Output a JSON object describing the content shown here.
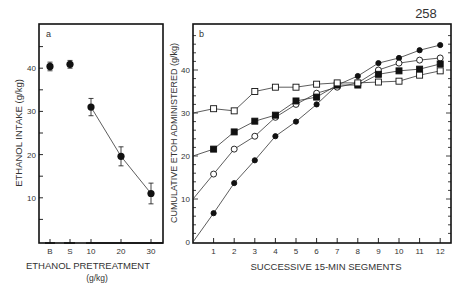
{
  "page_number": "258",
  "chart_data": [
    {
      "panel": "a",
      "type": "scatter",
      "title": "",
      "panel_label": "a",
      "xlabel": "ETHANOL PRETREATMENT",
      "xlabel_units": "(g/kg)",
      "ylabel": "ETHANOL INTAKE (g/kg)",
      "categories": [
        "B",
        "S",
        "10",
        "20",
        "30"
      ],
      "values": [
        40.4,
        40.9,
        31.0,
        19.6,
        11.0
      ],
      "error": [
        1.0,
        0.9,
        2.0,
        2.2,
        2.4
      ],
      "connected": [
        false,
        false,
        true,
        true,
        true
      ],
      "yticks": [
        10,
        20,
        30,
        40
      ],
      "ylim": [
        0,
        50
      ],
      "grid": false,
      "marker": "filled-circle"
    },
    {
      "panel": "b",
      "type": "line",
      "title": "",
      "panel_label": "b",
      "xlabel": "SUCCESSIVE 15-MIN SEGMENTS",
      "ylabel": "CUMULATIVE ETOH ADMINISTERED (g/kg)",
      "x": [
        0,
        1,
        2,
        3,
        4,
        5,
        6,
        7,
        8,
        9,
        10,
        11,
        12
      ],
      "xticks": [
        1,
        2,
        3,
        4,
        5,
        6,
        7,
        8,
        9,
        10,
        11,
        12
      ],
      "yticks": [
        0,
        10,
        20,
        30,
        40
      ],
      "xlim": [
        0,
        12.5
      ],
      "ylim": [
        0,
        50
      ],
      "grid": false,
      "legend": "none",
      "series": [
        {
          "name": "0 g/kg start",
          "marker": "filled-circle",
          "values": [
            0,
            6.7,
            13.7,
            19.0,
            24.6,
            28.0,
            32.0,
            36.5,
            38.6,
            41.6,
            42.8,
            44.6,
            45.8
          ]
        },
        {
          "name": "10 g/kg start",
          "marker": "open-circle",
          "values": [
            10,
            15.8,
            21.6,
            24.6,
            29.0,
            32.0,
            34.6,
            36.0,
            37.0,
            40.0,
            41.6,
            42.3,
            42.8
          ]
        },
        {
          "name": "20 g/kg start",
          "marker": "filled-square",
          "values": [
            20,
            21.6,
            25.6,
            28.1,
            29.5,
            32.8,
            33.7,
            36.5,
            36.5,
            39.0,
            39.8,
            40.2,
            41.4
          ]
        },
        {
          "name": "30 g/kg start",
          "marker": "open-square",
          "values": [
            30,
            31.0,
            30.5,
            35.0,
            36.0,
            36.0,
            36.7,
            37.0,
            37.0,
            37.2,
            37.4,
            38.8,
            39.8
          ]
        }
      ]
    }
  ]
}
